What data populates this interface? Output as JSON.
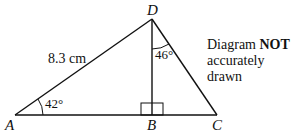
{
  "diagram": {
    "points": {
      "A": {
        "label": "A",
        "x": 15,
        "y": 115
      },
      "B": {
        "label": "B",
        "x": 152,
        "y": 115
      },
      "C": {
        "label": "C",
        "x": 217,
        "y": 115
      },
      "D": {
        "label": "D",
        "x": 152,
        "y": 19
      }
    },
    "side_label": "8.3 cm",
    "angle_A": "42°",
    "angle_D": "46°",
    "note_prefix": "Diagram ",
    "note_bold": "NOT",
    "note_line2": "accurately drawn",
    "line_color": "#111111"
  }
}
